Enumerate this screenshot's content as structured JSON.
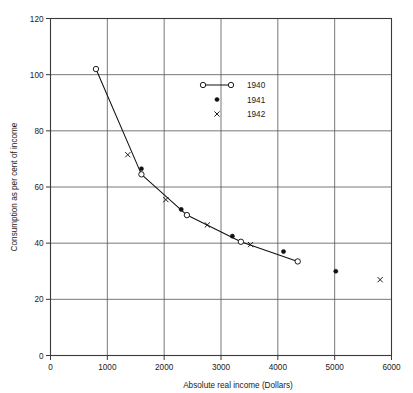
{
  "chart_data": {
    "type": "scatter",
    "title": "",
    "subtitle": "",
    "xlabel": "Absolute real income (Dollars)",
    "ylabel": "Consumption as per cent of income",
    "xlim": [
      0,
      6000
    ],
    "ylim": [
      0,
      120
    ],
    "xticks": [
      0,
      1000,
      2000,
      3000,
      4000,
      5000,
      6000
    ],
    "yticks": [
      0,
      20,
      40,
      60,
      80,
      100,
      120
    ],
    "xtick_labels": [
      "0",
      "1000",
      "2000",
      "3000",
      "4000",
      "5000",
      "6000"
    ],
    "ytick_labels": [
      "0",
      "20",
      "40",
      "60",
      "80",
      "100",
      "120"
    ],
    "grid": true,
    "grid_style": "both-axes-solid",
    "legend_position": "upper-center",
    "series": [
      {
        "name": "1940",
        "marker": "open-circle",
        "line": true,
        "points": [
          {
            "x": 800,
            "y": 102
          },
          {
            "x": 1600,
            "y": 64.5
          },
          {
            "x": 2400,
            "y": 50
          },
          {
            "x": 3350,
            "y": 40.5
          },
          {
            "x": 4350,
            "y": 33.5
          }
        ]
      },
      {
        "name": "1941",
        "marker": "filled-circle",
        "line": false,
        "points": [
          {
            "x": 1600,
            "y": 66.5
          },
          {
            "x": 2300,
            "y": 52
          },
          {
            "x": 3200,
            "y": 42.5
          },
          {
            "x": 4100,
            "y": 37
          },
          {
            "x": 5020,
            "y": 30
          }
        ]
      },
      {
        "name": "1942",
        "marker": "cross",
        "line": false,
        "points": [
          {
            "x": 1360,
            "y": 71.5
          },
          {
            "x": 2030,
            "y": 55.5
          },
          {
            "x": 2760,
            "y": 46.5
          },
          {
            "x": 3520,
            "y": 39.5
          },
          {
            "x": 5800,
            "y": 27
          }
        ]
      }
    ]
  },
  "legend": {
    "entries": [
      {
        "label": "1940",
        "marker": "open-circle-line"
      },
      {
        "label": "1941",
        "marker": "filled-circle"
      },
      {
        "label": "1942",
        "marker": "cross"
      }
    ]
  },
  "colors": {
    "ink": "#111111",
    "grid": "#555555",
    "axis": "#3a3a3a",
    "background": "#ffffff"
  }
}
